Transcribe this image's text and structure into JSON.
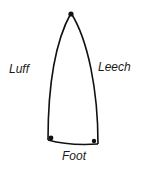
{
  "diagram": {
    "labels": {
      "luff": "Luff",
      "leech": "Leech",
      "foot": "Foot"
    },
    "colors": {
      "stroke": "#111111",
      "background": "#ffffff",
      "text": "#1a1a1a"
    }
  }
}
